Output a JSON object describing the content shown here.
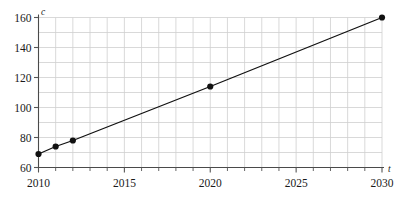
{
  "chart_data": {
    "type": "line",
    "title": "",
    "subtitle": "",
    "xlabel": "t",
    "ylabel": "c",
    "xlim": [
      2009.5,
      2031
    ],
    "ylim": [
      57,
      163
    ],
    "grid": true,
    "grid_x_step": 1,
    "grid_y_step": 10,
    "legend": "none",
    "markers": "filled-circle",
    "line_color": "#111111",
    "marker_color": "#111111",
    "grid_color": "#cfcfcf",
    "axis_color": "#555555",
    "x": [
      2010,
      2011,
      2012,
      2020,
      2030
    ],
    "values": [
      69,
      74,
      78,
      114,
      160
    ],
    "series": [
      {
        "name": "c",
        "x": [
          2010,
          2011,
          2012,
          2020,
          2030
        ],
        "values": [
          69,
          74,
          78,
          114,
          160
        ]
      }
    ],
    "xticks": [
      2010,
      2015,
      2020,
      2025,
      2030
    ],
    "xtick_labels": [
      "2010",
      "2015",
      "2020",
      "2025",
      "2030"
    ],
    "yticks": [
      60,
      80,
      100,
      120,
      140,
      160
    ],
    "ytick_labels": [
      "60",
      "80",
      "100",
      "120",
      "140",
      "160"
    ],
    "annotations": []
  },
  "axes": {
    "y_axis_symbol": "c",
    "x_axis_symbol": "t"
  },
  "ticks": {
    "y": [
      {
        "label": "160",
        "value": 160
      },
      {
        "label": "140",
        "value": 140
      },
      {
        "label": "120",
        "value": 120
      },
      {
        "label": "100",
        "value": 100
      },
      {
        "label": "80",
        "value": 80
      },
      {
        "label": "60",
        "value": 60
      }
    ],
    "x": [
      {
        "label": "2010",
        "value": 2010
      },
      {
        "label": "2015",
        "value": 2015
      },
      {
        "label": "2020",
        "value": 2020
      },
      {
        "label": "2025",
        "value": 2025
      },
      {
        "label": "2030",
        "value": 2030
      }
    ]
  }
}
